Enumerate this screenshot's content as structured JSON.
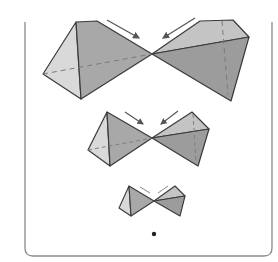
{
  "figure": {
    "colors": {
      "background": "#ffffff",
      "frame": "#8a8a8a",
      "edge": "#3a3a3a",
      "face_light": "#d9d9d9",
      "face_mid": "#b4b4b4",
      "face_dark": "#9c9c9c",
      "arrow": "#555555",
      "dashed": "#7a7a7a",
      "dot": "#222222"
    },
    "bowties": [
      {
        "name": "large",
        "center": [
          152,
          54
        ]
      },
      {
        "name": "medium",
        "center": [
          152,
          138
        ]
      },
      {
        "name": "small",
        "center": [
          154,
          201
        ]
      }
    ],
    "point": {
      "cx": 154,
      "cy": 234
    }
  }
}
